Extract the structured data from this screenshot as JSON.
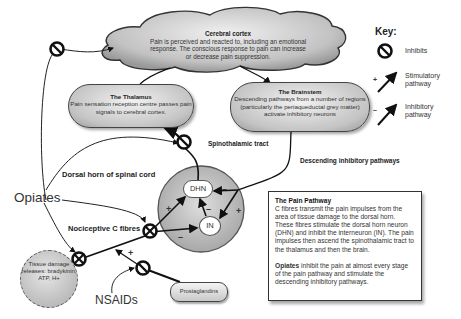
{
  "diagram": {
    "title": "The Pain Pathway",
    "cerebral_cortex": {
      "title": "Cerebral cortex",
      "text": "Pain is perceived and reacted to, including an emotional response. The conscious response to pain can increase or decrease pain suppression."
    },
    "thalamus": {
      "title": "The Thalamus",
      "text": "Pain sensation reception centre passes pain signals to cerebral cortex."
    },
    "brainstem": {
      "title": "The Brainstem",
      "text": "Descending pathways from a number of regions (particularly the periaqueductal grey matter) activate inhibitory neurons"
    },
    "labels": {
      "spinothalamic_tract": "Spinothalamic tract",
      "descending_pathways": "Descending inhibitory pathways",
      "dorsal_horn": "Dorsal horn of spinal cord",
      "nociceptive": "Nociceptive C fibres",
      "opiates": "Opiates",
      "nsaids": "NSAIDs"
    },
    "nodes": {
      "dhn": "DHN",
      "in": "IN",
      "tissue_damage": "Tissue damage releases: bradykinin, ATP, H+",
      "prostaglandins": "Prostaglandins"
    },
    "signs": {
      "plus": "+",
      "minus": "–"
    },
    "key": {
      "title": "Key:",
      "items": [
        {
          "icon": "inhibit-icon",
          "label": "Inhibits"
        },
        {
          "icon": "stimulatory-arrow-icon",
          "sign": "+",
          "label": "Stimulatory pathway"
        },
        {
          "icon": "inhibitory-arrow-icon",
          "sign": "–",
          "label": "Inhibitory pathway"
        }
      ]
    },
    "info_box": {
      "heading": "The Pain Pathway",
      "paragraph1": "C fibres transmit the pain impulses from the area of tissue damage to the dorsal horn. These fibres stimulate the dorsal horn neuron (DHN) and inhibit the interneuron (IN). The pain impulses then ascend the spinothalamic tract to the thalamus and then the brain.",
      "paragraph2_bold": "Opiates",
      "paragraph2_rest": " inhibit the pain at almost every stage of the pain pathway and stimulate the descending inhibitory pathways."
    }
  }
}
